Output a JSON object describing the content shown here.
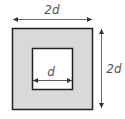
{
  "diagram": {
    "type": "square-frame-dimensions",
    "outer_square": {
      "fill": "#d9d9d9",
      "stroke": "#222222"
    },
    "inner_square": {
      "fill": "#ffffff",
      "stroke": "#222222"
    },
    "labels": {
      "top_width": "2d",
      "right_height": "2d",
      "inner_width": "d"
    },
    "arrow_color": "#444444"
  }
}
